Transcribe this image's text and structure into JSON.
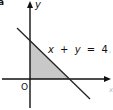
{
  "figure": {
    "part_label": "a",
    "axes": {
      "x_label": "x",
      "y_label": "y",
      "origin_label": "O"
    },
    "line": {
      "equation_label": "x + y = 4",
      "equation_parts": [
        "x",
        "+",
        "y",
        "=",
        "4"
      ],
      "intercepts": {
        "x": 4,
        "y": 4
      }
    },
    "shaded_region": {
      "vertices": [
        [
          0,
          0
        ],
        [
          4,
          0
        ],
        [
          0,
          4
        ]
      ],
      "fill_color": "#c8c8c8"
    },
    "colors": {
      "axis": "#111111",
      "line": "#222222",
      "text": "#111111",
      "background": "#ffffff"
    }
  }
}
